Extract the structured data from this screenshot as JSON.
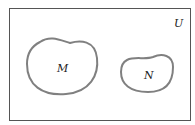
{
  "diagram": {
    "type": "venn",
    "universe": {
      "label": "U"
    },
    "sets": [
      {
        "label": "M"
      },
      {
        "label": "N"
      }
    ],
    "colors": {
      "border": "#555555",
      "set_outline": "#808080",
      "text": "#222222"
    }
  }
}
